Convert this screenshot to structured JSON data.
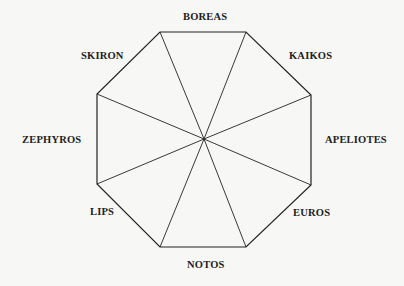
{
  "diagram": {
    "stroke_color": "#222222",
    "background": "#f7f7f5",
    "center": [
      204,
      139
    ],
    "vertices": [
      [
        160,
        32
      ],
      [
        246,
        32
      ],
      [
        311,
        95
      ],
      [
        311,
        185
      ],
      [
        246,
        247
      ],
      [
        160,
        247
      ],
      [
        97,
        184
      ],
      [
        97,
        94
      ]
    ],
    "winds": [
      {
        "name": "BOREAS",
        "direction": "N",
        "x": 183,
        "y": 11
      },
      {
        "name": "KAIKOS",
        "direction": "NE",
        "x": 289,
        "y": 50
      },
      {
        "name": "APELIOTES",
        "direction": "E",
        "x": 325,
        "y": 134
      },
      {
        "name": "EUROS",
        "direction": "SE",
        "x": 293,
        "y": 207
      },
      {
        "name": "NOTOS",
        "direction": "S",
        "x": 187,
        "y": 259
      },
      {
        "name": "LIPS",
        "direction": "SW",
        "x": 90,
        "y": 206
      },
      {
        "name": "ZEPHYROS",
        "direction": "W",
        "x": 22,
        "y": 134
      },
      {
        "name": "SKIRON",
        "direction": "NW",
        "x": 81,
        "y": 50
      }
    ]
  }
}
